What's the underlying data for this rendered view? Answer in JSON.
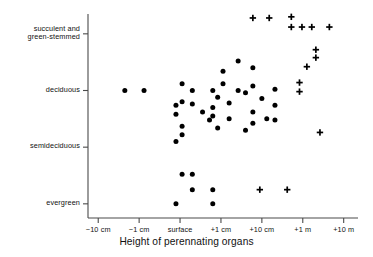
{
  "chart_data": {
    "type": "scatter",
    "title": "",
    "xlabel": "Height of perennating organs",
    "ylabel": "",
    "grid": false,
    "legend": "none",
    "x_ticklabels": [
      "−10 cm",
      "−1 cm",
      "surface",
      "+1 cm",
      "+10 cm",
      "+1 m",
      "+10 m"
    ],
    "x_tickvalues": [
      -2,
      -1,
      0,
      1,
      2,
      3,
      4
    ],
    "y_ticklabels": [
      "succulent and green-stemmed",
      "deciduous",
      "semideciduous",
      "evergreen"
    ],
    "y_tickvalues": [
      3,
      2,
      1,
      0
    ],
    "y_tick_lines": [
      [
        "succulent and",
        "green-stemmed"
      ],
      [
        "deciduous"
      ],
      [
        "semideciduous"
      ],
      [
        "evergreen"
      ]
    ],
    "xlim": [
      -2.25,
      4.35
    ],
    "ylim": [
      -0.25,
      3.35
    ],
    "series": [
      {
        "name": "dot",
        "marker": "filled-circle",
        "color": "#000000",
        "points": [
          [
            -1.35,
            2.0
          ],
          [
            -0.88,
            2.0
          ],
          [
            -0.1,
            1.74
          ],
          [
            -0.1,
            1.58
          ],
          [
            -0.1,
            1.1
          ],
          [
            -0.1,
            0.0
          ],
          [
            0.05,
            2.12
          ],
          [
            0.05,
            1.8
          ],
          [
            0.05,
            1.37
          ],
          [
            0.05,
            1.22
          ],
          [
            0.05,
            0.52
          ],
          [
            0.3,
            2.0
          ],
          [
            0.3,
            1.76
          ],
          [
            0.3,
            0.52
          ],
          [
            0.3,
            0.25
          ],
          [
            0.55,
            1.62
          ],
          [
            0.72,
            1.48
          ],
          [
            0.8,
            2.0
          ],
          [
            0.8,
            1.7
          ],
          [
            0.8,
            1.55
          ],
          [
            0.8,
            0.25
          ],
          [
            0.8,
            0.0
          ],
          [
            0.92,
            1.88
          ],
          [
            0.92,
            1.34
          ],
          [
            1.05,
            2.34
          ],
          [
            1.05,
            2.12
          ],
          [
            1.2,
            1.78
          ],
          [
            1.2,
            1.5
          ],
          [
            1.42,
            2.52
          ],
          [
            1.42,
            2.0
          ],
          [
            1.6,
            1.96
          ],
          [
            1.6,
            1.3
          ],
          [
            1.78,
            2.4
          ],
          [
            1.78,
            2.08
          ],
          [
            1.78,
            1.62
          ],
          [
            1.78,
            1.42
          ],
          [
            2.0,
            1.86
          ],
          [
            2.12,
            1.5
          ],
          [
            2.32,
            2.02
          ],
          [
            2.32,
            1.74
          ],
          [
            2.32,
            1.48
          ]
        ]
      },
      {
        "name": "plus",
        "marker": "plus",
        "color": "#000000",
        "points": [
          [
            1.78,
            3.28
          ],
          [
            2.18,
            3.28
          ],
          [
            2.72,
            3.3
          ],
          [
            2.72,
            3.12
          ],
          [
            2.98,
            3.12
          ],
          [
            3.22,
            3.12
          ],
          [
            3.65,
            3.12
          ],
          [
            3.32,
            2.72
          ],
          [
            3.32,
            2.58
          ],
          [
            3.1,
            2.42
          ],
          [
            2.92,
            2.14
          ],
          [
            2.92,
            1.98
          ],
          [
            3.42,
            1.26
          ],
          [
            1.95,
            0.25
          ],
          [
            2.62,
            0.25
          ]
        ]
      }
    ]
  },
  "axes": {
    "axis_color": "#4a4a4a",
    "tick_color": "#4a4a4a"
  }
}
